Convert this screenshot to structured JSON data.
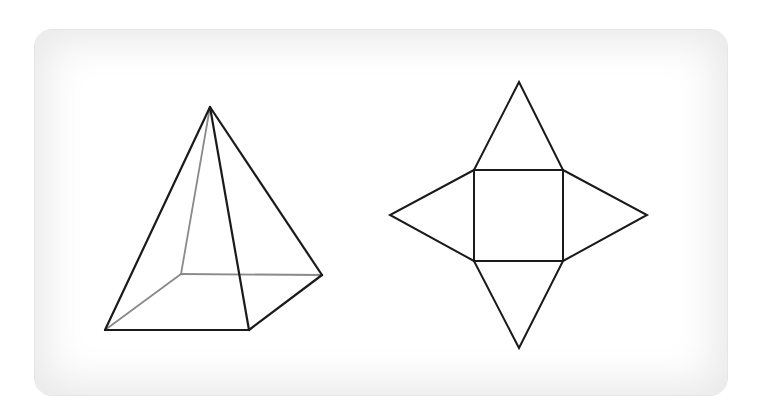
{
  "diagram": {
    "colors": {
      "visible_edge": "#1a1a1a",
      "hidden_edge": "#8a8a8a",
      "panel_background": "#ffffff"
    },
    "pyramid": {
      "vertices": {
        "apex": [
          210,
          107
        ],
        "base_back_left": [
          181,
          274
        ],
        "base_front_left": [
          105,
          330
        ],
        "base_front_right": [
          249,
          330
        ],
        "base_back_right": [
          322,
          275
        ]
      },
      "visible_edges": [
        [
          "apex",
          "base_front_left"
        ],
        [
          "apex",
          "base_front_right"
        ],
        [
          "apex",
          "base_back_right"
        ],
        [
          "base_front_left",
          "base_front_right"
        ],
        [
          "base_front_right",
          "base_back_right"
        ]
      ],
      "hidden_edges": [
        [
          "apex",
          "base_back_left"
        ],
        [
          "base_back_left",
          "base_front_left"
        ],
        [
          "base_back_left",
          "base_back_right"
        ]
      ]
    },
    "net": {
      "square": [
        [
          474,
          170
        ],
        [
          563,
          170
        ],
        [
          563,
          261
        ],
        [
          474,
          261
        ]
      ],
      "triangles": {
        "top": [
          [
            474,
            170
          ],
          [
            519,
            82
          ],
          [
            563,
            170
          ]
        ],
        "right": [
          [
            563,
            170
          ],
          [
            647,
            215
          ],
          [
            563,
            261
          ]
        ],
        "bottom": [
          [
            474,
            261
          ],
          [
            519,
            348
          ],
          [
            563,
            261
          ]
        ],
        "left": [
          [
            474,
            170
          ],
          [
            390,
            215
          ],
          [
            474,
            261
          ]
        ]
      }
    }
  }
}
